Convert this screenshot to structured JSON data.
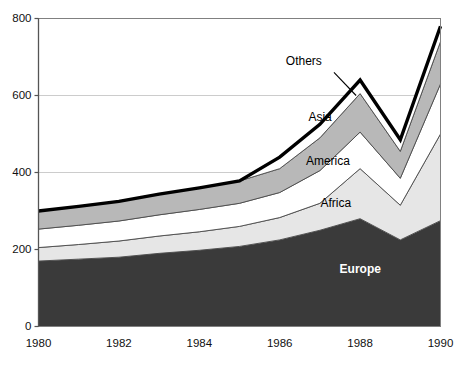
{
  "chart_data": {
    "type": "area",
    "stacked": true,
    "title": "",
    "subtitle": "",
    "xlabel": "",
    "ylabel": "",
    "x": [
      1980,
      1981,
      1982,
      1983,
      1984,
      1985,
      1986,
      1987,
      1988,
      1989,
      1990
    ],
    "xtick_labels": [
      "1980",
      "1982",
      "1984",
      "1986",
      "1988",
      "1990"
    ],
    "xtick_values": [
      1980,
      1982,
      1984,
      1986,
      1988,
      1990
    ],
    "xlim": [
      1980,
      1990
    ],
    "ytick_labels": [
      "0",
      "200",
      "400",
      "600",
      "800"
    ],
    "ytick_values": [
      0,
      200,
      400,
      600,
      800
    ],
    "ylim": [
      0,
      800
    ],
    "grid": "horizontal",
    "legend_position": "inline-annotations",
    "series": [
      {
        "name": "Europe",
        "color": "#3a3a3a",
        "label_x": 1988,
        "label_y": 150,
        "values": [
          170,
          175,
          180,
          190,
          198,
          208,
          225,
          250,
          280,
          225,
          275
        ]
      },
      {
        "name": "Africa",
        "color": "#e6e6e6",
        "label_x": 1987.4,
        "label_y": 320,
        "values": [
          35,
          38,
          42,
          45,
          48,
          52,
          58,
          70,
          130,
          90,
          225
        ]
      },
      {
        "name": "America",
        "color": "#ffffff",
        "label_x": 1987.2,
        "label_y": 430,
        "values": [
          48,
          50,
          52,
          55,
          58,
          60,
          65,
          85,
          95,
          70,
          130
        ]
      },
      {
        "name": "Asia",
        "color": "#b8b8b8",
        "label_x": 1987.0,
        "label_y": 545,
        "values": [
          47,
          49,
          51,
          54,
          56,
          58,
          62,
          85,
          100,
          70,
          110
        ]
      },
      {
        "name": "Others",
        "color": "#ffffff",
        "label_x": 1986.6,
        "label_y": 690,
        "values": [
          0,
          0,
          0,
          0,
          0,
          0,
          30,
          35,
          35,
          30,
          40
        ]
      }
    ],
    "totals": [
      300,
      312,
      325,
      344,
      360,
      378,
      440,
      525,
      640,
      485,
      780
    ],
    "outline_color": "#000000",
    "annotation_leader": {
      "from_x": 1987.35,
      "from_y": 660,
      "to_x": 1987.9,
      "to_y": 600
    }
  },
  "axes": {
    "axis_color": "#6b6b6b",
    "grid_color": "#cccccc",
    "plot_border_color": "#808080"
  }
}
